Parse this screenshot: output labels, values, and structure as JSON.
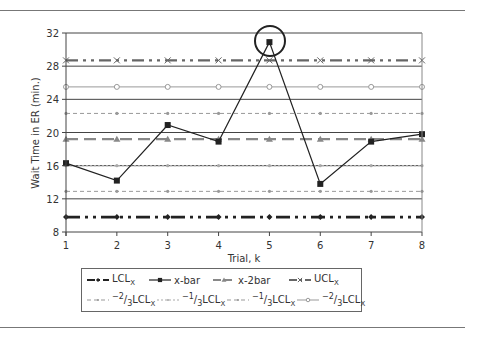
{
  "chart_data": {
    "type": "line",
    "title": "",
    "xlabel": "Trial, k",
    "ylabel": "Wait Time in ER (min.)",
    "x": [
      1,
      2,
      3,
      4,
      5,
      6,
      7,
      8
    ],
    "xticks": [
      "1",
      "2",
      "3",
      "4",
      "5",
      "6",
      "7",
      "8"
    ],
    "yticks": [
      "8",
      "12",
      "16",
      "20",
      "24",
      "28",
      "32"
    ],
    "ylim": [
      8,
      32
    ],
    "xlim": [
      1,
      8
    ],
    "grid": "horizontal major lines at y ticks",
    "legend_position": "below",
    "series": [
      {
        "name": "LCLx",
        "values": [
          9.8,
          9.8,
          9.8,
          9.8,
          9.8,
          9.8,
          9.8,
          9.8
        ],
        "style": "dash-dot-dot heavy, dark",
        "color": "#222222"
      },
      {
        "name": "x-bar",
        "values": [
          16.3,
          14.2,
          20.9,
          18.9,
          30.9,
          13.8,
          18.9,
          19.8
        ],
        "style": "solid with square markers",
        "color": "#222222"
      },
      {
        "name": "x-2bar",
        "values": [
          19.2,
          19.2,
          19.2,
          19.2,
          19.2,
          19.2,
          19.2,
          19.2
        ],
        "style": "long dash gray, triangle markers",
        "color": "#888888"
      },
      {
        "name": "UCLx",
        "values": [
          28.7,
          28.7,
          28.7,
          28.7,
          28.7,
          28.7,
          28.7,
          28.7
        ],
        "style": "dash-dot-dot gray heavy",
        "color": "#666666"
      },
      {
        "name": "-2/3 LCLx",
        "values": [
          12.9,
          12.9,
          12.9,
          12.9,
          12.9,
          12.9,
          12.9,
          12.9
        ],
        "style": "short dash gray",
        "color": "#999999"
      },
      {
        "name": "-1/3 LCLx",
        "values": [
          16.0,
          16.0,
          16.0,
          16.0,
          16.0,
          16.0,
          16.0,
          16.0
        ],
        "style": "dotted gray",
        "color": "#aaaaaa"
      },
      {
        "name": "-1/3 LCLx (upper)",
        "values": [
          22.3,
          22.3,
          22.3,
          22.3,
          22.3,
          22.3,
          22.3,
          22.3
        ],
        "style": "short dash gray",
        "color": "#999999"
      },
      {
        "name": "-2/3 LCLx (upper)",
        "values": [
          25.5,
          25.5,
          25.5,
          25.5,
          25.5,
          25.5,
          25.5,
          25.5
        ],
        "style": "solid gray with open circle markers",
        "color": "#999999"
      }
    ],
    "annotations": [
      {
        "type": "circle",
        "x": 5,
        "y": 30.9,
        "note": "out-of-control point above UCL"
      }
    ]
  },
  "legend": {
    "row1": [
      {
        "label": "LCL",
        "sub": "X"
      },
      {
        "label": "x-bar",
        "sub": ""
      },
      {
        "label": "x-2bar",
        "sub": ""
      },
      {
        "label": "UCL",
        "sub": "X"
      }
    ],
    "row2": [
      {
        "prefix": "−2",
        "frac": "3",
        "label": "LCL",
        "sub": "X"
      },
      {
        "prefix": "−1",
        "frac": "3",
        "label": "LCL",
        "sub": "X"
      },
      {
        "prefix": "−1",
        "frac": "3",
        "label": "LCL",
        "sub": "X"
      },
      {
        "prefix": "−2",
        "frac": "3",
        "label": "LCL",
        "sub": "X"
      }
    ]
  }
}
